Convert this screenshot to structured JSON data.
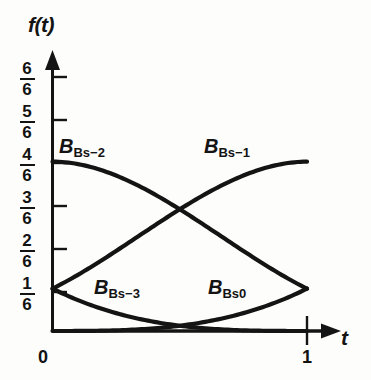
{
  "figure": {
    "background_color": "#fdfdfc",
    "ink_color": "#141414"
  },
  "axes": {
    "y_axis_name": "f(t)",
    "x_axis_name": "t",
    "y_ticks": [
      {
        "num": "6",
        "den": "6",
        "value": 1.0
      },
      {
        "num": "5",
        "den": "6",
        "value": 0.8333
      },
      {
        "num": "4",
        "den": "6",
        "value": 0.6667
      },
      {
        "num": "3",
        "den": "6",
        "value": 0.5
      },
      {
        "num": "2",
        "den": "6",
        "value": 0.3333
      },
      {
        "num": "1",
        "den": "6",
        "value": 0.1667
      }
    ],
    "x_ticks": [
      {
        "label": "0",
        "value": 0
      },
      {
        "label": "1",
        "value": 1
      }
    ]
  },
  "curve_labels": [
    {
      "id": "bs-2",
      "base": "B",
      "sub": "Bs−2"
    },
    {
      "id": "bs-1",
      "base": "B",
      "sub": "Bs−1"
    },
    {
      "id": "bs-3",
      "base": "B",
      "sub": "Bs−3"
    },
    {
      "id": "bs0",
      "base": "B",
      "sub": "Bs0"
    }
  ],
  "chart_data": {
    "type": "line",
    "xlabel": "t",
    "ylabel": "f(t)",
    "xlim": [
      0,
      1
    ],
    "ylim": [
      0,
      1
    ],
    "grid": false,
    "legend": "inline-annotations",
    "x_tick_values": [
      0,
      1
    ],
    "x_tick_labels": [
      "0",
      "1"
    ],
    "y_tick_values": [
      0.1667,
      0.3333,
      0.5,
      0.6667,
      0.8333,
      1.0
    ],
    "y_tick_labels": [
      "1/6",
      "2/6",
      "3/6",
      "4/6",
      "5/6",
      "6/6"
    ],
    "x": [
      0.0,
      0.1,
      0.2,
      0.3,
      0.4,
      0.5,
      0.6,
      0.7,
      0.8,
      0.9,
      1.0
    ],
    "series": [
      {
        "name": "B_Bs-3",
        "formula": "(1-t)^3/6",
        "values": [
          0.1667,
          0.1215,
          0.0853,
          0.0572,
          0.036,
          0.0208,
          0.0107,
          0.0045,
          0.0013,
          0.0002,
          0.0
        ]
      },
      {
        "name": "B_Bs-2",
        "formula": "(3t^3 - 6t^2 + 4)/6",
        "values": [
          0.6667,
          0.6388,
          0.5627,
          0.453,
          0.3253,
          0.1958,
          0.0813,
          0.0022,
          0.0213,
          0.1268,
          0.1667
        ]
      },
      {
        "name": "B_Bs-1",
        "formula": "(-3t^3 + 3t^2 + 3t + 1)/6",
        "values": [
          0.1667,
          0.2387,
          0.3493,
          0.4745,
          0.5907,
          0.6458,
          0.6813,
          0.6722,
          0.6453,
          0.6065,
          0.6667
        ]
      },
      {
        "name": "B_Bs0",
        "formula": "t^3/6",
        "values": [
          0.0,
          0.0002,
          0.0013,
          0.0045,
          0.0107,
          0.0208,
          0.036,
          0.0572,
          0.0853,
          0.1215,
          0.1667
        ]
      }
    ],
    "annotations": [
      {
        "text": "B_Bs-2",
        "x": 0.12,
        "y": 0.8
      },
      {
        "text": "B_Bs-1",
        "x": 0.6,
        "y": 0.8
      },
      {
        "text": "B_Bs-3",
        "x": 0.27,
        "y": 0.2
      },
      {
        "text": "B_Bs0",
        "x": 0.66,
        "y": 0.2
      }
    ]
  }
}
